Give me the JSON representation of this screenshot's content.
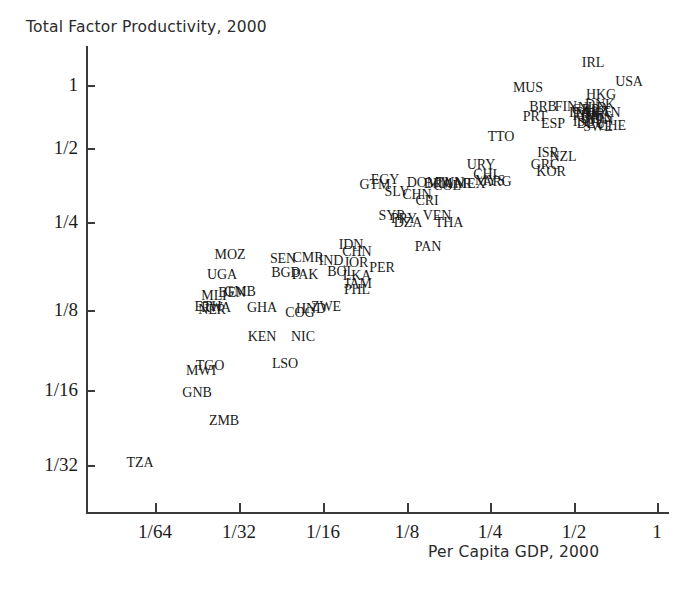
{
  "chart_data": {
    "type": "scatter",
    "title": "Total Factor Productivity, 2000",
    "ylabel": "Total Factor Productivity, 2000",
    "xlabel": "Per Capita GDP, 2000",
    "xscale": "log2",
    "yscale": "log2",
    "grid": false,
    "legend": "none",
    "point_marker": "text-label",
    "xticklabels": [
      "1/64",
      "1/32",
      "1/16",
      "1/8",
      "1/4",
      "1/2",
      "1"
    ],
    "xtickvalues": [
      0.015625,
      0.03125,
      0.0625,
      0.125,
      0.25,
      0.5,
      1
    ],
    "yticklabels": [
      "1",
      "1/2",
      "1/4",
      "1/8",
      "1/16",
      "1/32"
    ],
    "ytickvalues": [
      1,
      0.5,
      0.25,
      0.125,
      0.0625,
      0.03125
    ],
    "xlim": [
      0.0098,
      1.55
    ],
    "ylim": [
      0.0225,
      1.32
    ],
    "points": [
      {
        "label": "TZA",
        "px": 140,
        "py": 463,
        "x": 0.0195,
        "y": 0.0321
      },
      {
        "label": "ZMB",
        "px": 224,
        "py": 421,
        "x": 0.032,
        "y": 0.0443
      },
      {
        "label": "GNB",
        "px": 197,
        "py": 393,
        "x": 0.0276,
        "y": 0.0566
      },
      {
        "label": "MWI",
        "px": 201,
        "py": 371,
        "x": 0.0283,
        "y": 0.0693
      },
      {
        "label": "TGO",
        "px": 210,
        "py": 366,
        "x": 0.0296,
        "y": 0.0729
      },
      {
        "label": "LSO",
        "px": 285,
        "py": 364,
        "x": 0.0428,
        "y": 0.0744
      },
      {
        "label": "KEN",
        "px": 262,
        "py": 337,
        "x": 0.0384,
        "y": 0.0972
      },
      {
        "label": "NIC",
        "px": 303,
        "py": 337,
        "x": 0.0463,
        "y": 0.0972
      },
      {
        "label": "NER",
        "px": 212,
        "py": 310,
        "x": 0.03,
        "y": 0.125
      },
      {
        "label": "RWA",
        "px": 216,
        "py": 308,
        "x": 0.0305,
        "y": 0.1272
      },
      {
        "label": "ETH",
        "px": 208,
        "py": 307,
        "x": 0.0292,
        "y": 0.1283
      },
      {
        "label": "GHA",
        "px": 262,
        "py": 308,
        "x": 0.0384,
        "y": 0.1272
      },
      {
        "label": "COG",
        "px": 300,
        "py": 313,
        "x": 0.0456,
        "y": 0.1216
      },
      {
        "label": "HND",
        "px": 311,
        "py": 309,
        "x": 0.0478,
        "y": 0.1261
      },
      {
        "label": "ZWE",
        "px": 326,
        "py": 307,
        "x": 0.051,
        "y": 0.1283
      },
      {
        "label": "MLI",
        "px": 214,
        "py": 296,
        "x": 0.0302,
        "y": 0.1417
      },
      {
        "label": "BEN",
        "px": 232,
        "py": 293,
        "x": 0.0334,
        "y": 0.1455
      },
      {
        "label": "GMB",
        "px": 240,
        "py": 292,
        "x": 0.035,
        "y": 0.1468
      },
      {
        "label": "UGA",
        "px": 222,
        "py": 275,
        "x": 0.0317,
        "y": 0.1701
      },
      {
        "label": "BGD",
        "px": 286,
        "py": 273,
        "x": 0.0431,
        "y": 0.1731
      },
      {
        "label": "PAK",
        "px": 305,
        "py": 275,
        "x": 0.0468,
        "y": 0.1701
      },
      {
        "label": "BOL",
        "px": 341,
        "py": 272,
        "x": 0.0544,
        "y": 0.1746
      },
      {
        "label": "LKA",
        "px": 357,
        "py": 276,
        "x": 0.0581,
        "y": 0.1687
      },
      {
        "label": "JAM",
        "px": 358,
        "py": 284,
        "x": 0.0584,
        "y": 0.1578
      },
      {
        "label": "PHL",
        "px": 357,
        "py": 290,
        "x": 0.0581,
        "y": 0.15
      },
      {
        "label": "MOZ",
        "px": 230,
        "py": 255,
        "x": 0.0334,
        "y": 0.2014
      },
      {
        "label": "SEN",
        "px": 283,
        "py": 259,
        "x": 0.0422,
        "y": 0.1952
      },
      {
        "label": "CMR",
        "px": 308,
        "py": 258,
        "x": 0.0473,
        "y": 0.1967
      },
      {
        "label": "IND",
        "px": 331,
        "py": 261,
        "x": 0.0523,
        "y": 0.1923
      },
      {
        "label": "IDN",
        "px": 351,
        "py": 245,
        "x": 0.0568,
        "y": 0.2178
      },
      {
        "label": "CHN",
        "px": 357,
        "py": 252,
        "x": 0.0581,
        "y": 0.206
      },
      {
        "label": "JOR",
        "px": 356,
        "py": 263,
        "x": 0.0578,
        "y": 0.1894
      },
      {
        "label": "PER",
        "px": 382,
        "py": 268,
        "x": 0.064,
        "y": 0.182
      },
      {
        "label": "PAN",
        "px": 428,
        "py": 247,
        "x": 0.0765,
        "y": 0.2146
      },
      {
        "label": "SYR",
        "px": 392,
        "py": 216,
        "x": 0.0664,
        "y": 0.2698
      },
      {
        "label": "DZA",
        "px": 408,
        "py": 223,
        "x": 0.0704,
        "y": 0.2571
      },
      {
        "label": "PRY",
        "px": 404,
        "py": 219,
        "x": 0.0694,
        "y": 0.2643
      },
      {
        "label": "VEN",
        "px": 437,
        "py": 216,
        "x": 0.079,
        "y": 0.2698
      },
      {
        "label": "THA",
        "px": 449,
        "py": 223,
        "x": 0.0827,
        "y": 0.2571
      },
      {
        "label": "CRI",
        "px": 427,
        "py": 201,
        "x": 0.0761,
        "y": 0.2993
      },
      {
        "label": "CHN2",
        "px": 417,
        "py": 195,
        "x": 0.0733,
        "y": 0.3126
      },
      {
        "label": "SLV",
        "px": 397,
        "py": 192,
        "x": 0.0676,
        "y": 0.3196
      },
      {
        "label": "EGY",
        "px": 385,
        "py": 180,
        "x": 0.0644,
        "y": 0.3494
      },
      {
        "label": "GTM",
        "px": 375,
        "py": 185,
        "x": 0.0618,
        "y": 0.3367
      },
      {
        "label": "DOM",
        "px": 423,
        "py": 183,
        "x": 0.0749,
        "y": 0.3417
      },
      {
        "label": "TUN",
        "px": 450,
        "py": 183,
        "x": 0.0829,
        "y": 0.3417
      },
      {
        "label": "MAR",
        "px": 456,
        "py": 184,
        "x": 0.0848,
        "y": 0.3392
      },
      {
        "label": "MEX",
        "px": 470,
        "py": 184,
        "x": 0.0891,
        "y": 0.3392
      },
      {
        "label": "COL",
        "px": 447,
        "py": 186,
        "x": 0.0822,
        "y": 0.3343
      },
      {
        "label": "BRA",
        "px": 438,
        "py": 184,
        "x": 0.0795,
        "y": 0.3392
      },
      {
        "label": "MYS",
        "px": 490,
        "py": 181,
        "x": 0.0956,
        "y": 0.3468
      },
      {
        "label": "ARG",
        "px": 497,
        "py": 182,
        "x": 0.0979,
        "y": 0.3443
      },
      {
        "label": "CHL",
        "px": 487,
        "py": 175,
        "x": 0.0946,
        "y": 0.3624
      },
      {
        "label": "URY",
        "px": 481,
        "py": 165,
        "x": 0.0927,
        "y": 0.3894
      },
      {
        "label": "TTO",
        "px": 501,
        "py": 137,
        "x": 0.0993,
        "y": 0.4776
      },
      {
        "label": "GRC",
        "px": 545,
        "py": 165,
        "x": 0.115,
        "y": 0.3894
      },
      {
        "label": "KOR",
        "px": 551,
        "py": 172,
        "x": 0.1173,
        "y": 0.3702
      },
      {
        "label": "ISR",
        "px": 548,
        "py": 153,
        "x": 0.1151,
        "y": 0.4229
      },
      {
        "label": "NZL",
        "px": 563,
        "py": 157,
        "x": 0.121,
        "y": 0.4112
      },
      {
        "label": "MUS",
        "px": 528,
        "py": 88,
        "x": 0.1075,
        "y": 0.7047
      },
      {
        "label": "BRB",
        "px": 543,
        "py": 107,
        "x": 0.113,
        "y": 0.6115
      },
      {
        "label": "PRT",
        "px": 535,
        "py": 117,
        "x": 0.11,
        "y": 0.5678
      },
      {
        "label": "ESP",
        "px": 553,
        "py": 124,
        "x": 0.117,
        "y": 0.5386
      },
      {
        "label": "FIN",
        "px": 566,
        "py": 107,
        "x": 0.122,
        "y": 0.6115
      },
      {
        "label": "IRL",
        "px": 593,
        "py": 63,
        "x": 0.133,
        "y": 0.8389
      },
      {
        "label": "HKG",
        "px": 601,
        "py": 95,
        "x": 0.1363,
        "y": 0.67
      },
      {
        "label": "USA",
        "px": 629,
        "py": 82,
        "x": 0.148,
        "y": 0.7376
      },
      {
        "label": "DNK",
        "px": 600,
        "py": 105,
        "x": 0.136,
        "y": 0.6206
      },
      {
        "label": "NLD",
        "px": 592,
        "py": 108,
        "x": 0.1327,
        "y": 0.6069
      },
      {
        "label": "GBR",
        "px": 586,
        "py": 110,
        "x": 0.1303,
        "y": 0.598
      },
      {
        "label": "AUT",
        "px": 596,
        "py": 112,
        "x": 0.1344,
        "y": 0.5893
      },
      {
        "label": "CAN",
        "px": 606,
        "py": 113,
        "x": 0.1386,
        "y": 0.5851
      },
      {
        "label": "AUS",
        "px": 598,
        "py": 117,
        "x": 0.1352,
        "y": 0.5678
      },
      {
        "label": "NOR",
        "px": 590,
        "py": 114,
        "x": 0.1319,
        "y": 0.5809
      },
      {
        "label": "BEL",
        "px": 594,
        "py": 119,
        "x": 0.1336,
        "y": 0.5595
      },
      {
        "label": "FRA",
        "px": 586,
        "py": 116,
        "x": 0.1303,
        "y": 0.5721
      },
      {
        "label": "ITA",
        "px": 580,
        "py": 113,
        "x": 0.1279,
        "y": 0.5851
      },
      {
        "label": "JPN",
        "px": 602,
        "py": 120,
        "x": 0.1369,
        "y": 0.5553
      },
      {
        "label": "SWE",
        "px": 598,
        "py": 127,
        "x": 0.1352,
        "y": 0.5267
      },
      {
        "label": "CHE",
        "px": 612,
        "py": 126,
        "x": 0.1411,
        "y": 0.5308
      },
      {
        "label": "DEU",
        "px": 591,
        "py": 124,
        "x": 0.1323,
        "y": 0.5386
      },
      {
        "label": "ISL",
        "px": 583,
        "py": 122,
        "x": 0.129,
        "y": 0.5469
      }
    ]
  }
}
